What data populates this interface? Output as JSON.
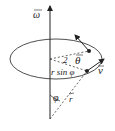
{
  "diagram": {
    "labels": {
      "omega": "ω",
      "theta": "θ",
      "v": "v",
      "rsinphi": "r sin φ",
      "phi": "φ",
      "r": "r",
      "two": "2"
    },
    "colors": {
      "stroke": "#222222",
      "background": "#ffffff"
    }
  }
}
